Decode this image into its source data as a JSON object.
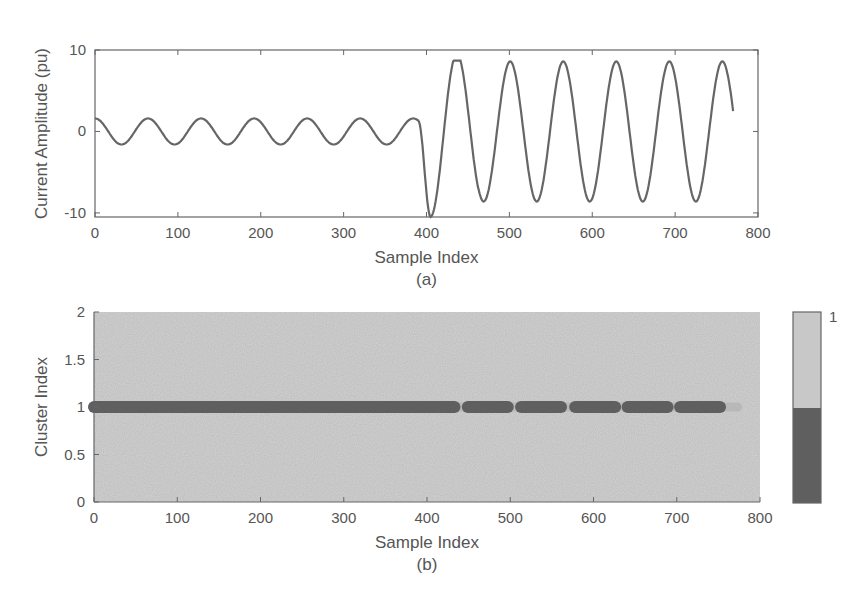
{
  "chart_data": [
    {
      "panel": "a",
      "type": "line",
      "caption": "(a)",
      "xlabel": "Sample Index",
      "ylabel": "Current Amplitude (pu)",
      "xlim": [
        0,
        800
      ],
      "ylim": [
        -10.5,
        10
      ],
      "xticks": [
        "0",
        "100",
        "200",
        "300",
        "400",
        "500",
        "600",
        "700",
        "800"
      ],
      "yticks": [
        "10",
        "0",
        "-10"
      ],
      "grid": false,
      "series": [
        {
          "name": "current",
          "description": "Pre-fault sinusoid amplitude ~1.6 pu, period ~64 samples, from 0 to ~390; fault at ~390 after which amplitude rises to ~8.5 pu, first trough ~-10.5 at ~405, ending at sample ~770",
          "segments": [
            {
              "x_start": 0,
              "x_end": 390,
              "amplitude": 1.6,
              "period": 64,
              "phase_peak_at": 0
            },
            {
              "x_start": 390,
              "x_end": 770,
              "amplitude": 8.6,
              "period": 64,
              "first_trough_x": 405,
              "first_trough_y": -10.5,
              "first_peak_x": 443,
              "first_peak_y": 7.8
            }
          ]
        }
      ]
    },
    {
      "panel": "b",
      "type": "scatter",
      "caption": "(b)",
      "xlabel": "Sample Index",
      "ylabel": "Cluster Index",
      "xlim": [
        0,
        800
      ],
      "ylim": [
        0,
        2
      ],
      "xticks": [
        "0",
        "100",
        "200",
        "300",
        "400",
        "500",
        "600",
        "700",
        "800"
      ],
      "yticks": [
        "0",
        "0.5",
        "1",
        "1.5",
        "2"
      ],
      "grid": false,
      "y_value": 1,
      "dark_segments": [
        [
          0,
          433
        ],
        [
          449,
          497
        ],
        [
          513,
          561
        ],
        [
          578,
          626
        ],
        [
          641,
          689
        ],
        [
          704,
          752
        ]
      ],
      "light_tail": [
        752,
        773
      ],
      "colorbar": {
        "tick_label": "1",
        "levels": [
          "light",
          "dark"
        ]
      }
    }
  ]
}
